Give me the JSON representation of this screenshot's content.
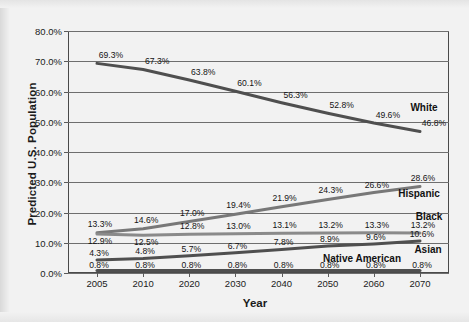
{
  "chart_data": {
    "type": "line",
    "title": "",
    "xlabel": "Year",
    "ylabel": "Predicted U.S. Population",
    "x": [
      2005,
      2010,
      2020,
      2030,
      2040,
      2050,
      2060,
      2070
    ],
    "xtick_labels": [
      "2005",
      "2010",
      "2020",
      "2030",
      "2040",
      "2050",
      "2060",
      "2070"
    ],
    "ytick_labels": [
      "0.0%",
      "10.0%",
      "20.0%",
      "30.0%",
      "40.0%",
      "50.0%",
      "60.0%",
      "70.0%",
      "80.0%"
    ],
    "yticks": [
      0,
      10,
      20,
      30,
      40,
      50,
      60,
      70,
      80
    ],
    "ylim": [
      0,
      80
    ],
    "grid": "horizontal",
    "legend_position": "inline-right-labels",
    "series": [
      {
        "name": "White",
        "color": "#4f4f4f",
        "values": [
          69.3,
          67.3,
          63.8,
          60.1,
          56.3,
          52.8,
          49.6,
          46.8
        ],
        "labels": [
          "69.3%",
          "67.3%",
          "63.8%",
          "60.1%",
          "56.3%",
          "52.8%",
          "49.6%",
          "46.8%"
        ]
      },
      {
        "name": "Hispanic",
        "color": "#787878",
        "values": [
          13.3,
          14.6,
          17.0,
          19.4,
          21.9,
          24.3,
          26.6,
          28.6
        ],
        "labels": [
          "13.3%",
          "14.6%",
          "17.0%",
          "19.4%",
          "21.9%",
          "24.3%",
          "26.6%",
          "28.6%"
        ]
      },
      {
        "name": "Black",
        "color": "#8a8a8a",
        "values": [
          12.9,
          12.5,
          12.8,
          13.0,
          13.1,
          13.2,
          13.3,
          13.2
        ],
        "labels": [
          "12.9%",
          "12.5%",
          "12.8%",
          "13.0%",
          "13.1%",
          "13.2%",
          "13.3%",
          "13.2%"
        ]
      },
      {
        "name": "Asian",
        "color": "#4f4f4f",
        "values": [
          4.3,
          4.8,
          5.7,
          6.7,
          7.8,
          8.9,
          9.6,
          10.6
        ],
        "labels": [
          "4.3%",
          "4.8%",
          "5.7%",
          "6.7%",
          "7.8%",
          "8.9%",
          "9.6%",
          "10.6%"
        ]
      },
      {
        "name": "Native American",
        "color": "#4f4f4f",
        "values": [
          0.8,
          0.8,
          0.8,
          0.8,
          0.8,
          0.8,
          0.8,
          0.8
        ],
        "labels": [
          "0.8%",
          "0.8%",
          "0.8%",
          "0.8%",
          "0.8%",
          "0.8%",
          "0.8%",
          "0.8%"
        ]
      }
    ]
  }
}
